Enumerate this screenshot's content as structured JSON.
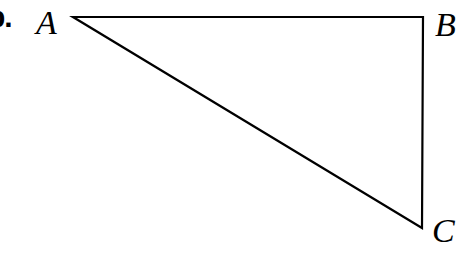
{
  "figure": {
    "list_marker": "b.",
    "stroke_color": "#000000",
    "background_color": "#ffffff",
    "stroke_width": 2.2,
    "vertices": [
      {
        "name": "A",
        "label": "A",
        "x": 73,
        "y": 17,
        "label_x": 36,
        "label_y": 6
      },
      {
        "name": "B",
        "label": "B",
        "x": 423,
        "y": 17,
        "label_x": 435,
        "label_y": 8
      },
      {
        "name": "C",
        "label": "C",
        "x": 422,
        "y": 228,
        "label_x": 432,
        "label_y": 214
      }
    ],
    "sides": [
      {
        "name": "AB",
        "from": "A",
        "to": "B",
        "orientation": "horizontal"
      },
      {
        "name": "BC",
        "from": "B",
        "to": "C",
        "orientation": "vertical"
      },
      {
        "name": "CA",
        "from": "C",
        "to": "A",
        "orientation": "diagonal"
      }
    ],
    "path": "M 73 17 L 423 17 L 422 228 Z"
  }
}
